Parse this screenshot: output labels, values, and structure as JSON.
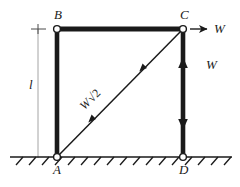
{
  "figure": {
    "ink_color": "#1a1a1a",
    "dim_color": "#8c8c8c",
    "background": "#ffffff"
  },
  "nodes": [
    {
      "id": "B",
      "label": "B",
      "x": 57,
      "y": 29,
      "label_x": 54,
      "label_y": 8
    },
    {
      "id": "C",
      "label": "C",
      "x": 183,
      "y": 29,
      "label_x": 180,
      "label_y": 8
    },
    {
      "id": "A",
      "label": "A",
      "x": 57,
      "y": 157,
      "label_x": 53,
      "label_y": 163
    },
    {
      "id": "D",
      "label": "D",
      "x": 183,
      "y": 157,
      "label_x": 179,
      "label_y": 163
    }
  ],
  "members": [
    {
      "name": "member-BC",
      "from": "B",
      "to": "C",
      "style": "thick-bar"
    },
    {
      "name": "member-AB",
      "from": "A",
      "to": "B",
      "style": "thick-bar"
    },
    {
      "name": "member-CD",
      "from": "C",
      "to": "D",
      "style": "thick-bar"
    },
    {
      "name": "member-AC",
      "from": "A",
      "to": "C",
      "style": "thin-line"
    }
  ],
  "force_labels": {
    "horizontal_at_C": "W",
    "vertical_on_CD": "W",
    "diagonal_AC_base": "W",
    "diagonal_AC_radical": "√2",
    "diagonal_AC_radicand": "2"
  },
  "dimension": {
    "label": "l",
    "label_x": 30,
    "label_y": 84,
    "from_y": 29,
    "to_y": 157,
    "x": 38
  },
  "ground": {
    "name": "ground-line",
    "y": 157,
    "x_start": 10,
    "x_end": 232,
    "hatch_count": 17
  },
  "arrows": {
    "at_C_horizontal": {
      "direction": "right",
      "x1": 189,
      "y1": 29,
      "x2": 208,
      "y2": 29
    },
    "on_CD_up": {
      "direction": "up",
      "x": 183,
      "y": 63
    },
    "on_CD_down": {
      "direction": "down",
      "x": 183,
      "y": 122
    },
    "on_AC_lower": {
      "direction": "up-right",
      "x": 96,
      "y": 119
    },
    "on_AC_upper": {
      "direction": "up-right",
      "x": 147,
      "y": 68
    }
  }
}
